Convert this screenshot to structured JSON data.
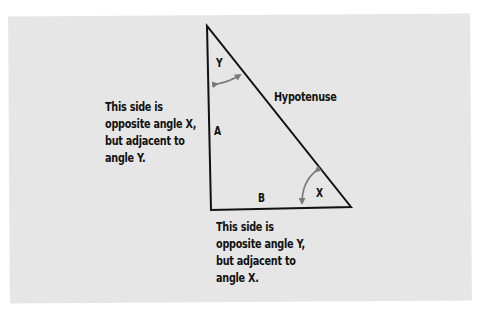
{
  "diagram": {
    "colors": {
      "background": "#ffffff",
      "panel": "#e6e6e6",
      "lines": "#111111",
      "arrows": "#7a7a7a",
      "text": "#111111"
    },
    "triangle": {
      "vertices": {
        "top": [
          207,
          26
        ],
        "right_angle": [
          211,
          210
        ],
        "right": [
          351,
          207
        ]
      }
    },
    "angles": {
      "y": {
        "label": "Y",
        "vertex": "top"
      },
      "x": {
        "label": "X",
        "vertex": "right"
      }
    },
    "sides": {
      "a": {
        "label": "A",
        "position": "vertical leg"
      },
      "b": {
        "label": "B",
        "position": "horizontal leg"
      },
      "hypotenuse": {
        "label": "Hypotenuse"
      }
    },
    "callouts": {
      "side_a": {
        "lines": [
          "This side is",
          "opposite angle X,",
          "but adjacent to",
          "angle Y."
        ]
      },
      "side_b": {
        "lines": [
          "This side is",
          "opposite angle Y,",
          "but adjacent to",
          "angle X."
        ]
      }
    }
  }
}
